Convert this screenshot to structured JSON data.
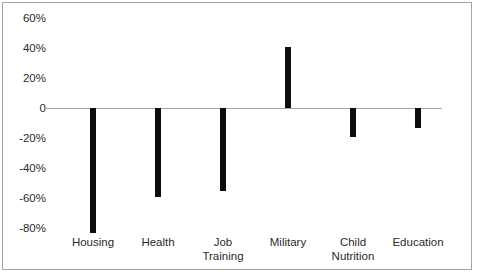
{
  "chart_data": {
    "type": "bar",
    "title": "",
    "subtitle": "",
    "xlabel": "",
    "ylabel": "",
    "categories": [
      "Housing",
      "Health",
      "Job\nTraining",
      "Military",
      "Child\nNutrition",
      "Education"
    ],
    "values": [
      -83,
      -59,
      -55,
      41,
      -19,
      -13
    ],
    "value_labels": [
      "-83%",
      "-59%",
      "-55%",
      "41%",
      "-19%",
      "-13%"
    ],
    "ytick_labels": [
      "60%",
      "40%",
      "20%",
      "0",
      "-20%",
      "-40%",
      "-60%",
      "-80%"
    ],
    "ytick_values": [
      60,
      40,
      20,
      0,
      -20,
      -40,
      -60,
      -80
    ],
    "ylim": [
      -90,
      65
    ],
    "grid": false,
    "legend": null,
    "legend_position": "none",
    "bar_color": "#0d0d0d",
    "axis_color": "#a6a6a6",
    "border_color": "#a6a6a6",
    "text_color": "#2b2b2b",
    "background_color": "#ffffff"
  },
  "axis": {
    "zero_line_label": "0"
  }
}
